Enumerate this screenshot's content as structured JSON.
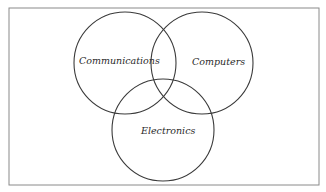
{
  "diagram": {
    "type": "venn",
    "frame": {
      "x": 9,
      "y": 8,
      "width": 310,
      "height": 177,
      "stroke": "#8a8a8a"
    },
    "circle_stroke": "#3a3a3a",
    "sets": [
      {
        "label": "Communications",
        "cx": 125,
        "cy": 63,
        "r": 51,
        "label_x": 79,
        "label_y": 64
      },
      {
        "label": "Computers",
        "cx": 202,
        "cy": 63,
        "r": 51,
        "label_x": 192,
        "label_y": 65
      },
      {
        "label": "Electronics",
        "cx": 163,
        "cy": 130,
        "r": 51,
        "label_x": 141,
        "label_y": 134
      }
    ]
  }
}
